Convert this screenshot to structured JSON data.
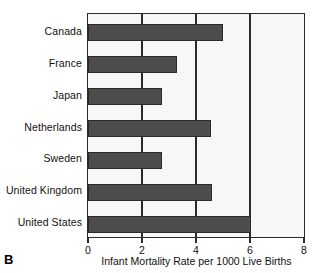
{
  "panel": {
    "label": "B"
  },
  "chart_data": {
    "type": "bar",
    "orientation": "horizontal",
    "title": "",
    "xlabel": "Infant Mortality Rate per 1000 Live Births",
    "ylabel": "",
    "categories": [
      "Canada",
      "France",
      "Japan",
      "Netherlands",
      "Sweden",
      "United Kingdom",
      "United States"
    ],
    "values": [
      5.0,
      3.3,
      2.75,
      4.55,
      2.75,
      4.6,
      6.05
    ],
    "xlim": [
      0,
      8
    ],
    "xticks": [
      0,
      2,
      4,
      6,
      8
    ],
    "xtick_labels": [
      "0",
      "2",
      "4",
      "6",
      "8"
    ],
    "gridlines_x": [
      2,
      4,
      6
    ],
    "grid": true,
    "legend": null,
    "colors": {
      "bar_fill": "#4d4d4d",
      "bar_edge": "#2b2b2b",
      "plot_background": "#f7f7f7",
      "axis": "#2b2b2b",
      "text": "#111111"
    }
  }
}
